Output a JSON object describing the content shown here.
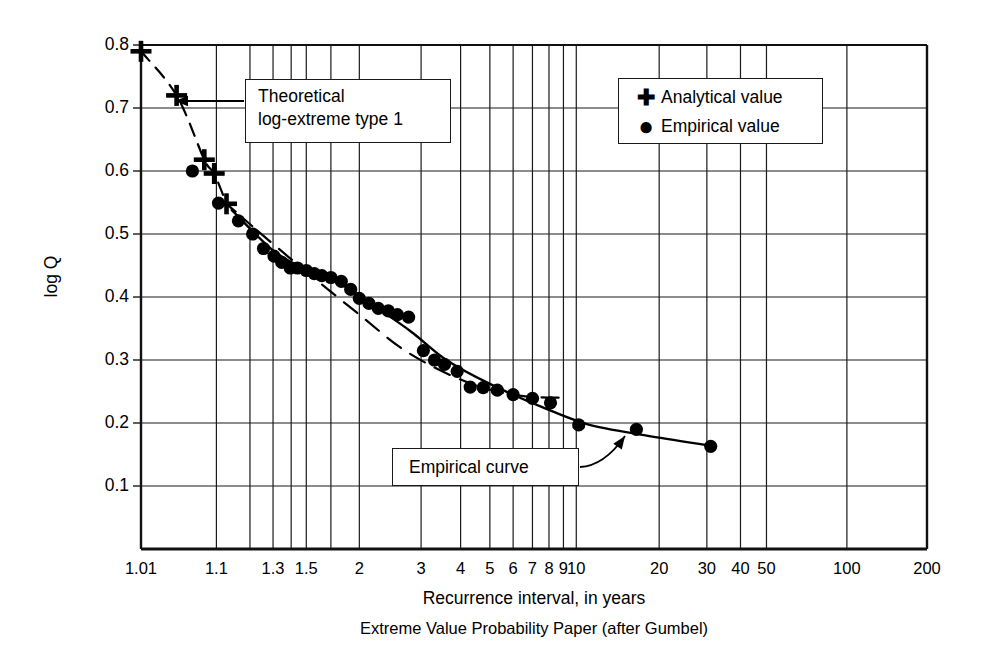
{
  "chart_data": {
    "type": "scatter",
    "title": "",
    "caption": "Extreme Value Probability Paper (after Gumbel)",
    "xlabel": "Recurrence interval, in years",
    "ylabel": "log Q",
    "xscale": "gumbel-extreme-value-probability",
    "grid": true,
    "ylim": [
      0.05,
      0.8
    ],
    "yticks": [
      "0.8",
      "0.7",
      "0.6",
      "0.5",
      "0.4",
      "0.3",
      "0.2",
      "0.1"
    ],
    "ytick_values": [
      0.8,
      0.7,
      0.6,
      0.5,
      0.4,
      0.3,
      0.2,
      0.1
    ],
    "xticks": [
      "1.01",
      "1.1",
      "1.3",
      "1.5",
      "2",
      "3",
      "4",
      "5",
      "6",
      "7",
      "8",
      "9",
      "10",
      "20",
      "30",
      "40",
      "50",
      "100",
      "200"
    ],
    "xtick_values": [
      1.01,
      1.1,
      1.3,
      1.5,
      2,
      3,
      4,
      5,
      6,
      7,
      8,
      9,
      10,
      20,
      30,
      40,
      50,
      100,
      200
    ],
    "xgrid_values": [
      1.01,
      1.1,
      1.2,
      1.3,
      1.4,
      1.5,
      1.7,
      2,
      3,
      4,
      5,
      6,
      7,
      8,
      9,
      10,
      20,
      30,
      40,
      50,
      100,
      200
    ],
    "legend": {
      "position": "top-right",
      "entries": [
        {
          "marker": "plus",
          "symbol": "✚",
          "label": "Analytical value"
        },
        {
          "marker": "circle",
          "symbol": "●",
          "label": "Empirical value"
        }
      ]
    },
    "annotations": [
      {
        "name": "theoretical-curve-label",
        "text": "Theoretical\nlog-extreme type 1",
        "arrow": true
      },
      {
        "name": "empirical-curve-label",
        "text": "Empirical curve",
        "arrow": true
      }
    ],
    "series": [
      {
        "name": "Analytical value",
        "marker": "plus",
        "linestyle": "dashed",
        "points": [
          {
            "x": 1.01,
            "y": 0.79
          },
          {
            "x": 1.035,
            "y": 0.72
          },
          {
            "x": 1.075,
            "y": 0.618
          },
          {
            "x": 1.095,
            "y": 0.596
          },
          {
            "x": 1.125,
            "y": 0.548
          }
        ]
      },
      {
        "name": "Empirical value",
        "marker": "circle",
        "points": [
          {
            "x": 1.055,
            "y": 0.6
          },
          {
            "x": 1.105,
            "y": 0.549
          },
          {
            "x": 1.16,
            "y": 0.521
          },
          {
            "x": 1.21,
            "y": 0.5
          },
          {
            "x": 1.255,
            "y": 0.477
          },
          {
            "x": 1.305,
            "y": 0.465
          },
          {
            "x": 1.345,
            "y": 0.455
          },
          {
            "x": 1.395,
            "y": 0.446
          },
          {
            "x": 1.44,
            "y": 0.446
          },
          {
            "x": 1.5,
            "y": 0.442
          },
          {
            "x": 1.56,
            "y": 0.437
          },
          {
            "x": 1.62,
            "y": 0.434
          },
          {
            "x": 1.7,
            "y": 0.431
          },
          {
            "x": 1.8,
            "y": 0.425
          },
          {
            "x": 1.9,
            "y": 0.412
          },
          {
            "x": 2.0,
            "y": 0.398
          },
          {
            "x": 2.12,
            "y": 0.39
          },
          {
            "x": 2.25,
            "y": 0.382
          },
          {
            "x": 2.4,
            "y": 0.378
          },
          {
            "x": 2.55,
            "y": 0.372
          },
          {
            "x": 2.75,
            "y": 0.368
          },
          {
            "x": 3.05,
            "y": 0.315
          },
          {
            "x": 3.3,
            "y": 0.3
          },
          {
            "x": 3.55,
            "y": 0.293
          },
          {
            "x": 3.9,
            "y": 0.282
          },
          {
            "x": 4.3,
            "y": 0.257
          },
          {
            "x": 4.75,
            "y": 0.256
          },
          {
            "x": 5.3,
            "y": 0.252
          },
          {
            "x": 6.0,
            "y": 0.245
          },
          {
            "x": 7.0,
            "y": 0.239
          },
          {
            "x": 8.1,
            "y": 0.232
          },
          {
            "x": 10.2,
            "y": 0.197
          },
          {
            "x": 16.5,
            "y": 0.19
          },
          {
            "x": 31.0,
            "y": 0.163
          }
        ]
      }
    ],
    "curves": [
      {
        "name": "Empirical curve",
        "style": "solid",
        "points": [
          {
            "x": 1.14,
            "y": 0.538
          },
          {
            "x": 1.3,
            "y": 0.474
          },
          {
            "x": 1.5,
            "y": 0.443
          },
          {
            "x": 1.8,
            "y": 0.42
          },
          {
            "x": 2.2,
            "y": 0.385
          },
          {
            "x": 2.8,
            "y": 0.345
          },
          {
            "x": 3.6,
            "y": 0.3
          },
          {
            "x": 5.0,
            "y": 0.262
          },
          {
            "x": 7.5,
            "y": 0.226
          },
          {
            "x": 11.0,
            "y": 0.198
          },
          {
            "x": 18.0,
            "y": 0.18
          },
          {
            "x": 31.0,
            "y": 0.164
          }
        ]
      },
      {
        "name": "Theoretical log-extreme type 1 (lower segment)",
        "style": "dashed",
        "points": [
          {
            "x": 1.23,
            "y": 0.505
          },
          {
            "x": 1.5,
            "y": 0.44
          },
          {
            "x": 2.0,
            "y": 0.372
          },
          {
            "x": 2.6,
            "y": 0.32
          },
          {
            "x": 3.4,
            "y": 0.285
          },
          {
            "x": 4.6,
            "y": 0.258
          },
          {
            "x": 6.4,
            "y": 0.243
          },
          {
            "x": 9.0,
            "y": 0.24
          }
        ]
      }
    ]
  }
}
